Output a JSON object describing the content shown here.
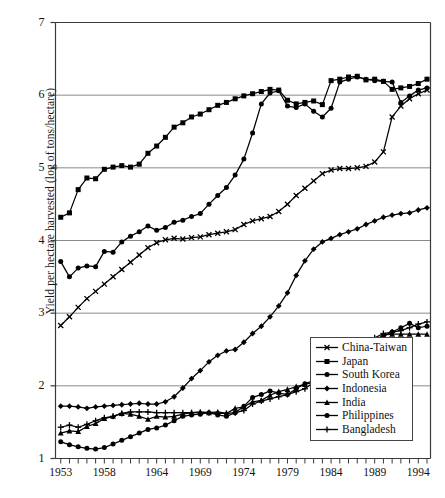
{
  "chart_data": {
    "type": "line",
    "title": "",
    "xlabel": "",
    "ylabel": "Yield per hectare harvested (log of tons/hectare)",
    "xlim": [
      1952.4,
      1995.4
    ],
    "ylim": [
      1,
      7
    ],
    "ytick_values": [
      1,
      2,
      3,
      4,
      5,
      6,
      7
    ],
    "ytick_labels": [
      "1",
      "2",
      "3",
      "4",
      "5",
      "6",
      "7"
    ],
    "xtick_labels": [
      "1953",
      "1958",
      "1964",
      "1969",
      "1974",
      "1979",
      "1984",
      "1989",
      "1994"
    ],
    "xtick_values": [
      1953,
      1958,
      1964,
      1969,
      1974,
      1979,
      1984,
      1989,
      1994
    ],
    "grid": "horizontal",
    "legend_position": "bottom-right",
    "x": [
      1953,
      1954,
      1955,
      1956,
      1957,
      1958,
      1959,
      1960,
      1961,
      1962,
      1963,
      1964,
      1965,
      1966,
      1967,
      1968,
      1969,
      1970,
      1971,
      1972,
      1973,
      1974,
      1975,
      1976,
      1977,
      1978,
      1979,
      1980,
      1981,
      1982,
      1983,
      1984,
      1985,
      1986,
      1987,
      1988,
      1989,
      1990,
      1991,
      1992,
      1993,
      1994,
      1995
    ],
    "series": [
      {
        "name": "China-Taiwan",
        "marker": "x",
        "values": [
          2.83,
          2.95,
          3.08,
          3.2,
          3.3,
          3.4,
          3.5,
          3.6,
          3.7,
          3.8,
          3.9,
          3.97,
          4.01,
          4.03,
          4.02,
          4.04,
          4.05,
          4.08,
          4.1,
          4.12,
          4.15,
          4.22,
          4.27,
          4.3,
          4.33,
          4.4,
          4.5,
          4.62,
          4.72,
          4.82,
          4.92,
          4.97,
          4.99,
          4.99,
          5.0,
          5.02,
          5.08,
          5.22,
          5.7,
          5.85,
          5.95,
          6.02,
          6.07
        ]
      },
      {
        "name": "Japan",
        "marker": "square",
        "values": [
          4.32,
          4.38,
          4.7,
          4.86,
          4.85,
          4.98,
          5.01,
          5.03,
          5.01,
          5.05,
          5.2,
          5.3,
          5.42,
          5.56,
          5.62,
          5.7,
          5.74,
          5.8,
          5.86,
          5.9,
          5.95,
          5.99,
          6.02,
          6.05,
          6.08,
          6.07,
          5.93,
          5.88,
          5.9,
          5.92,
          5.87,
          6.2,
          6.22,
          6.25,
          6.26,
          6.21,
          6.22,
          6.19,
          6.08,
          6.1,
          6.12,
          6.16,
          6.22
        ]
      },
      {
        "name": "South Korea",
        "marker": "circle-square",
        "values": [
          3.71,
          3.5,
          3.62,
          3.65,
          3.64,
          3.85,
          3.84,
          3.98,
          4.06,
          4.12,
          4.2,
          4.14,
          4.18,
          4.25,
          4.28,
          4.33,
          4.37,
          4.5,
          4.62,
          4.73,
          4.9,
          5.12,
          5.48,
          5.88,
          6.03,
          6.06,
          5.85,
          5.83,
          5.88,
          5.78,
          5.7,
          5.82,
          6.18,
          6.22,
          6.25,
          6.22,
          6.2,
          6.19,
          6.18,
          5.9,
          5.99,
          6.07,
          6.1
        ]
      },
      {
        "name": "Indonesia",
        "marker": "diamond",
        "values": [
          1.72,
          1.72,
          1.71,
          1.69,
          1.71,
          1.72,
          1.73,
          1.74,
          1.75,
          1.76,
          1.75,
          1.75,
          1.78,
          1.85,
          1.97,
          2.1,
          2.21,
          2.33,
          2.42,
          2.48,
          2.5,
          2.6,
          2.72,
          2.82,
          2.95,
          3.1,
          3.28,
          3.52,
          3.72,
          3.88,
          3.98,
          4.03,
          4.08,
          4.12,
          4.16,
          4.22,
          4.27,
          4.32,
          4.35,
          4.37,
          4.38,
          4.42,
          4.45
        ]
      },
      {
        "name": "India",
        "marker": "triangle",
        "values": [
          1.35,
          1.38,
          1.37,
          1.44,
          1.48,
          1.55,
          1.58,
          1.62,
          1.61,
          1.58,
          1.54,
          1.58,
          1.57,
          1.58,
          1.61,
          1.63,
          1.64,
          1.63,
          1.64,
          1.62,
          1.69,
          1.71,
          1.78,
          1.8,
          1.87,
          1.92,
          1.95,
          1.99,
          2.02,
          2.05,
          2.11,
          2.2,
          2.28,
          2.35,
          2.43,
          2.52,
          2.62,
          2.7,
          2.71,
          2.71,
          2.71,
          2.71,
          2.71
        ]
      },
      {
        "name": "Philippines",
        "marker": "circle",
        "values": [
          1.23,
          1.19,
          1.16,
          1.14,
          1.13,
          1.15,
          1.2,
          1.25,
          1.3,
          1.35,
          1.4,
          1.42,
          1.46,
          1.52,
          1.58,
          1.6,
          1.61,
          1.63,
          1.6,
          1.58,
          1.63,
          1.72,
          1.84,
          1.88,
          1.93,
          1.9,
          1.88,
          1.96,
          2.03,
          2.07,
          2.12,
          2.2,
          2.28,
          2.36,
          2.46,
          2.55,
          2.62,
          2.68,
          2.74,
          2.8,
          2.86,
          2.8,
          2.82
        ]
      },
      {
        "name": "Bangladesh",
        "marker": "plus",
        "values": [
          1.43,
          1.46,
          1.43,
          1.47,
          1.52,
          1.56,
          1.58,
          1.62,
          1.64,
          1.64,
          1.64,
          1.63,
          1.63,
          1.63,
          1.63,
          1.63,
          1.63,
          1.63,
          1.62,
          1.62,
          1.63,
          1.66,
          1.75,
          1.79,
          1.82,
          1.85,
          1.88,
          1.92,
          1.96,
          2.05,
          2.12,
          2.22,
          2.3,
          2.38,
          2.48,
          2.58,
          2.66,
          2.72,
          2.74,
          2.76,
          2.8,
          2.85,
          2.88
        ]
      }
    ]
  },
  "legend": {
    "items": [
      {
        "label": "China-Taiwan",
        "marker": "x"
      },
      {
        "label": "Japan",
        "marker": "square"
      },
      {
        "label": "South Korea",
        "marker": "circle-square"
      },
      {
        "label": "Indonesia",
        "marker": "diamond"
      },
      {
        "label": "India",
        "marker": "triangle"
      },
      {
        "label": "Philippines",
        "marker": "circle"
      },
      {
        "label": "Bangladesh",
        "marker": "plus"
      }
    ]
  },
  "colors": {
    "series": "#000000",
    "grid": "#8a8a8a",
    "axis": "#3a3a3a",
    "background": "#ffffff",
    "text": "#111111"
  }
}
